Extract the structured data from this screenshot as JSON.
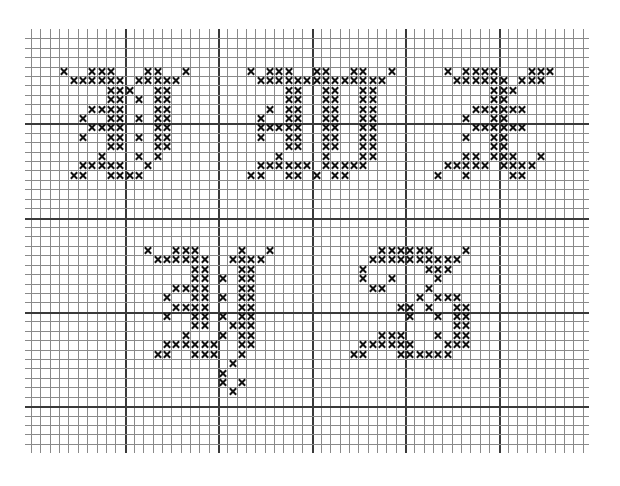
{
  "grid": {
    "columns": 59,
    "rows": 43,
    "origin_x": 31,
    "origin_y": 38.3,
    "cell_w": 9.35,
    "cell_h": 9.43,
    "major_every": 10,
    "line_color": "#8a8a8a",
    "major_line_color": "#3a3a3a",
    "mark_color": "#111111",
    "mark_symbol": "×"
  },
  "motifs": [
    {
      "name": "motif-top-left",
      "cells": {
        "3": [
          3,
          6,
          7,
          8,
          12,
          13,
          16
        ],
        "4": [
          4,
          5,
          6,
          7,
          8,
          9,
          11,
          12,
          13,
          14,
          15
        ],
        "5": [
          8,
          9,
          10,
          13,
          14
        ],
        "6": [
          8,
          9,
          11,
          13,
          14
        ],
        "7": [
          6,
          7,
          8,
          9,
          13,
          14
        ],
        "8": [
          5,
          8,
          9,
          11,
          13,
          14
        ],
        "9": [
          6,
          7,
          8,
          9,
          13,
          14
        ],
        "10": [
          5,
          8,
          9,
          11,
          13,
          14
        ],
        "11": [
          8,
          9,
          13,
          14
        ],
        "12": [
          7,
          11,
          13
        ],
        "13": [
          5,
          6,
          7,
          8,
          9,
          12
        ],
        "14": [
          4,
          5,
          8,
          9,
          10,
          11
        ]
      }
    },
    {
      "name": "motif-top-middle",
      "cells": {
        "3": [
          23,
          25,
          26,
          27,
          30,
          31,
          34,
          35,
          38
        ],
        "4": [
          24,
          25,
          26,
          27,
          28,
          29,
          30,
          31,
          32,
          33,
          34,
          35,
          36,
          37
        ],
        "5": [
          27,
          28,
          31,
          32,
          35,
          36
        ],
        "6": [
          27,
          28,
          31,
          32,
          35,
          36
        ],
        "7": [
          25,
          27,
          28,
          31,
          32,
          35,
          36
        ],
        "8": [
          24,
          27,
          28,
          31,
          32,
          35,
          36
        ],
        "9": [
          24,
          25,
          26,
          27,
          28,
          31,
          32,
          35,
          36
        ],
        "10": [
          24,
          27,
          28,
          31,
          32,
          35,
          36
        ],
        "11": [
          27,
          28,
          31,
          32,
          35,
          36
        ],
        "12": [
          26,
          31,
          35,
          36
        ],
        "13": [
          24,
          25,
          26,
          27,
          28,
          29,
          31,
          32,
          33,
          34,
          35
        ],
        "14": [
          23,
          24,
          27,
          28,
          30,
          32,
          33
        ]
      }
    },
    {
      "name": "motif-top-right",
      "cells": {
        "3": [
          44,
          46,
          47,
          48,
          49,
          53,
          54,
          55
        ],
        "4": [
          45,
          46,
          47,
          48,
          49,
          50,
          52,
          53,
          54
        ],
        "5": [
          49,
          50,
          51
        ],
        "6": [
          49,
          50
        ],
        "7": [
          47,
          48,
          49,
          50,
          51,
          52
        ],
        "8": [
          46,
          49,
          50
        ],
        "9": [
          47,
          48,
          49,
          50,
          51,
          52
        ],
        "10": [
          46,
          49,
          50
        ],
        "11": [
          49,
          50
        ],
        "12": [
          46,
          47,
          49,
          50,
          51,
          54
        ],
        "13": [
          44,
          45,
          46,
          47,
          48,
          50,
          51,
          52,
          53
        ],
        "14": [
          43,
          46,
          51,
          52
        ]
      }
    },
    {
      "name": "motif-bottom-left",
      "cells": {
        "22": [
          12,
          15,
          16,
          17,
          22,
          25
        ],
        "23": [
          13,
          14,
          15,
          16,
          17,
          18,
          21,
          22,
          23,
          24
        ],
        "24": [
          17,
          18,
          22,
          23
        ],
        "25": [
          17,
          18,
          20,
          22,
          23
        ],
        "26": [
          15,
          16,
          17,
          18,
          22,
          23
        ],
        "27": [
          14,
          17,
          18,
          20,
          22,
          23
        ],
        "28": [
          15,
          16,
          17,
          18,
          22,
          23
        ],
        "29": [
          14,
          17,
          18,
          20,
          22,
          23
        ],
        "30": [
          17,
          18,
          21,
          22,
          23
        ],
        "31": [
          16,
          20,
          22,
          23
        ],
        "32": [
          14,
          15,
          16,
          17,
          18,
          19,
          22,
          23
        ],
        "33": [
          13,
          14,
          17,
          18,
          19,
          22
        ],
        "34": [
          21
        ],
        "35": [
          20
        ],
        "36": [
          20,
          22
        ],
        "37": [
          21
        ]
      }
    },
    {
      "name": "motif-bottom-right",
      "cells": {
        "22": [
          37,
          38,
          39,
          40,
          41,
          42,
          46
        ],
        "23": [
          36,
          37,
          38,
          39,
          40,
          41,
          42,
          43,
          44,
          45
        ],
        "24": [
          35,
          42,
          43,
          44
        ],
        "25": [
          35,
          38,
          43
        ],
        "26": [
          36,
          37,
          42
        ],
        "27": [
          41,
          43,
          44,
          45
        ],
        "28": [
          39,
          40,
          42,
          45,
          46
        ],
        "29": [
          40,
          43,
          45,
          46
        ],
        "30": [
          45,
          46
        ],
        "31": [
          37,
          38,
          39,
          43,
          45,
          46
        ],
        "32": [
          35,
          36,
          37,
          38,
          39,
          40,
          44,
          45,
          46
        ],
        "33": [
          34,
          35,
          39,
          40,
          41,
          42,
          43,
          44
        ]
      }
    }
  ]
}
